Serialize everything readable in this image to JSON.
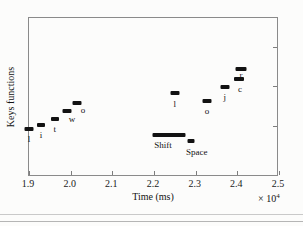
{
  "chart_data": {
    "type": "scatter",
    "title": "",
    "xlabel": "Time (ms)",
    "ylabel": "Keys functions",
    "x_exponent_label": "× 10",
    "x_exponent_power": "4",
    "x_multiplier": 10000,
    "xlim": [
      1.9,
      2.5
    ],
    "xticks": [
      1.9,
      2.0,
      2.1,
      2.2,
      2.3,
      2.4,
      2.5
    ],
    "xticklabels": [
      "1.9",
      "2.0",
      "2.1",
      "2.2",
      "2.3",
      "2.4",
      "2.5"
    ],
    "ylim": [
      0,
      1
    ],
    "yticks": [],
    "yticklabels": [],
    "y_right_tick_positions": [
      0.32,
      0.57,
      0.82
    ],
    "grid": false,
    "legend": null,
    "marker_shape": "horizontal-bar",
    "marker_color": "#121212",
    "points": [
      {
        "label": "l",
        "x": 1.9,
        "y": 0.302,
        "width": 9,
        "height": 4,
        "label_dx": 0,
        "label_dy": 6,
        "label_side": "below"
      },
      {
        "label": "i",
        "x": 1.929,
        "y": 0.327,
        "width": 8,
        "height": 4,
        "label_dx": 0,
        "label_dy": 6,
        "label_side": "below"
      },
      {
        "label": "t",
        "x": 1.962,
        "y": 0.365,
        "width": 8,
        "height": 4,
        "label_dx": 0,
        "label_dy": 6,
        "label_side": "below"
      },
      {
        "label": "w",
        "x": 1.991,
        "y": 0.415,
        "width": 9,
        "height": 4,
        "label_dx": 5,
        "label_dy": 4,
        "label_side": "right-below"
      },
      {
        "label": "o",
        "x": 2.015,
        "y": 0.465,
        "width": 9,
        "height": 4,
        "label_dx": 6,
        "label_dy": 3,
        "label_side": "right-below"
      },
      {
        "label": "Shift",
        "x": 2.236,
        "y": 0.264,
        "width": 33,
        "height": 4,
        "label_dx": -6,
        "label_dy": 6,
        "label_side": "below-left"
      },
      {
        "label": "l",
        "x": 2.25,
        "y": 0.528,
        "width": 9,
        "height": 4,
        "label_dx": 0,
        "label_dy": 7,
        "label_side": "below"
      },
      {
        "label": "Space",
        "x": 2.288,
        "y": 0.226,
        "width": 7,
        "height": 4,
        "label_dx": 6,
        "label_dy": 7,
        "label_side": "below-right"
      },
      {
        "label": "o",
        "x": 2.327,
        "y": 0.478,
        "width": 9,
        "height": 4,
        "label_dx": 0,
        "label_dy": 6,
        "label_side": "below"
      },
      {
        "label": "j",
        "x": 2.37,
        "y": 0.566,
        "width": 9,
        "height": 4,
        "label_dx": 0,
        "label_dy": 6,
        "label_side": "below"
      },
      {
        "label": "c",
        "x": 2.404,
        "y": 0.616,
        "width": 10,
        "height": 4,
        "label_dx": 1,
        "label_dy": 6,
        "label_side": "below"
      },
      {
        "label": "r",
        "x": 2.409,
        "y": 0.679,
        "width": 11,
        "height": 4,
        "label_dx": 0,
        "label_dy": 2,
        "label_side": "below"
      }
    ]
  },
  "axes": {
    "frame_color": "#8a8a8a",
    "tick_color": "#7d7d7d"
  },
  "xticklabels": [
    "1.9",
    "2.0",
    "2.1",
    "2.2",
    "2.3",
    "2.4",
    "2.5"
  ]
}
